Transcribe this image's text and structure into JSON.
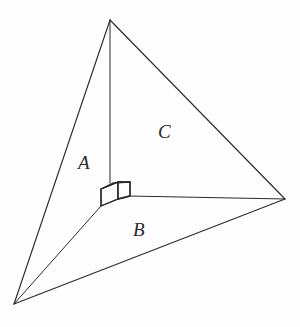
{
  "figure": {
    "background_color": "#fefefe",
    "stroke_color": "#2b2b30",
    "labels": {
      "A": "A",
      "B": "B",
      "C": "C"
    },
    "right_angle_marker": {
      "type": "cube",
      "name": "right-angle-cube-marker"
    },
    "vertices": {
      "apex_top": [
        110,
        20
      ],
      "bottom_left": [
        14,
        304
      ],
      "right": [
        285,
        199
      ],
      "corner_interior": [
        110,
        196
      ]
    },
    "edges": [
      {
        "name": "apex-to-bottom-left",
        "from": [
          110,
          20
        ],
        "to": [
          14,
          304
        ]
      },
      {
        "name": "apex-to-right",
        "from": [
          110,
          20
        ],
        "to": [
          285,
          199
        ]
      },
      {
        "name": "bottom-left-to-right",
        "from": [
          14,
          304
        ],
        "to": [
          285,
          199
        ]
      },
      {
        "name": "apex-to-corner",
        "from": [
          110,
          20
        ],
        "to": [
          110,
          196
        ]
      },
      {
        "name": "corner-to-bottom-left",
        "from": [
          110,
          196
        ],
        "to": [
          14,
          304
        ]
      },
      {
        "name": "corner-to-right",
        "from": [
          110,
          196
        ],
        "to": [
          285,
          199
        ]
      }
    ]
  }
}
